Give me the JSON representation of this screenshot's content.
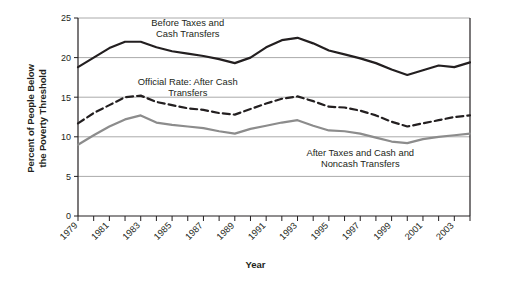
{
  "chart_data": {
    "type": "line",
    "title": "",
    "xlabel": "Year",
    "ylabel": "Percent of People Below the Poverty Threshold",
    "ylabel_line1": "Percent of People Below",
    "ylabel_line2": "the Poverty Threshold",
    "ylim": [
      0,
      25
    ],
    "yticks": [
      0,
      5,
      10,
      15,
      20,
      25
    ],
    "ytick_labels": [
      "0",
      "5",
      "10",
      "15",
      "20",
      "25"
    ],
    "xlim": [
      1979,
      2004
    ],
    "x": [
      1979,
      1980,
      1981,
      1982,
      1983,
      1984,
      1985,
      1986,
      1987,
      1988,
      1989,
      1990,
      1991,
      1992,
      1993,
      1994,
      1995,
      1996,
      1997,
      1998,
      1999,
      2000,
      2001,
      2002,
      2003,
      2004
    ],
    "xtick_labels": [
      "1979",
      "1981",
      "1983",
      "1985",
      "1987",
      "1989",
      "1991",
      "1993",
      "1995",
      "1997",
      "1999",
      "2001",
      "2003"
    ],
    "xtick_values": [
      1979,
      1981,
      1983,
      1985,
      1987,
      1989,
      1991,
      1993,
      1995,
      1997,
      1999,
      2001,
      2003
    ],
    "grid": "horizontal",
    "legend_position": "inline-annotations",
    "series": [
      {
        "name": "Before Taxes and Cash Transfers",
        "label_line1": "Before Taxes and",
        "label_line2": "Cash Transfers",
        "style": "solid",
        "color": "#231f20",
        "width": 2.2,
        "values": [
          18.8,
          20.0,
          21.2,
          22.0,
          22.0,
          21.3,
          20.8,
          20.5,
          20.2,
          19.8,
          19.3,
          20.0,
          21.3,
          22.2,
          22.5,
          21.8,
          20.9,
          20.4,
          19.9,
          19.3,
          18.5,
          17.8,
          18.4,
          19.0,
          18.8,
          19.4
        ],
        "annotation_x": 1986,
        "annotation_y": 24.0
      },
      {
        "name": "Official Rate: After Cash Transfers",
        "label_line1": "Official Rate: After Cash",
        "label_line2": "Transfers",
        "style": "dashed",
        "color": "#231f20",
        "width": 2.2,
        "values": [
          11.7,
          13.0,
          14.0,
          15.0,
          15.2,
          14.4,
          14.0,
          13.6,
          13.4,
          13.0,
          12.8,
          13.5,
          14.2,
          14.8,
          15.1,
          14.5,
          13.8,
          13.7,
          13.3,
          12.7,
          11.9,
          11.3,
          11.7,
          12.1,
          12.5,
          12.7
        ],
        "annotation_x": 1986,
        "annotation_y": 16.6
      },
      {
        "name": "After Taxes and Cash and Noncash Transfers",
        "label_line1": "After Taxes and Cash and",
        "label_line2": "Noncash Transfers",
        "style": "solid",
        "color": "#8c8c8c",
        "width": 2.2,
        "values": [
          9.0,
          10.2,
          11.3,
          12.2,
          12.7,
          11.8,
          11.5,
          11.3,
          11.1,
          10.7,
          10.4,
          11.0,
          11.4,
          11.8,
          12.1,
          11.4,
          10.8,
          10.7,
          10.4,
          9.9,
          9.4,
          9.2,
          9.7,
          10.0,
          10.2,
          10.4
        ],
        "annotation_x": 1997,
        "annotation_y": 7.6
      }
    ]
  },
  "axes": {
    "x_axis_title": "Year",
    "y_axis_title_line1": "Percent of People Below",
    "y_axis_title_line2": "the Poverty Threshold"
  }
}
